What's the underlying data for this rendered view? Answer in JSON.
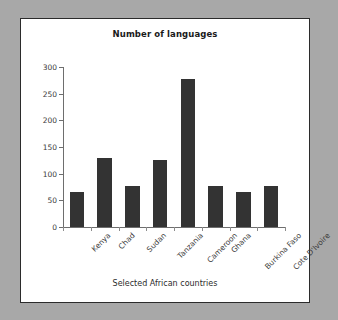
{
  "chart_data": {
    "type": "bar",
    "title": "Number of languages",
    "xlabel": "Selected African countries",
    "ylabel": "",
    "categories": [
      "Kenya",
      "Chad",
      "Sudan",
      "Tanzania",
      "Cameroon",
      "Ghana",
      "Burkina Faso",
      "Cote D'Ivoire"
    ],
    "values": [
      65,
      130,
      77,
      125,
      277,
      77,
      66,
      77
    ],
    "ylim": [
      0,
      300
    ],
    "yticks": [
      0,
      50,
      100,
      150,
      200,
      250,
      300
    ],
    "grid": false,
    "legend": false,
    "bar_color": "#333333",
    "panel_background": "#ffffff",
    "page_background": "#a8a8a8",
    "axis_color": "#6e6e6e"
  }
}
